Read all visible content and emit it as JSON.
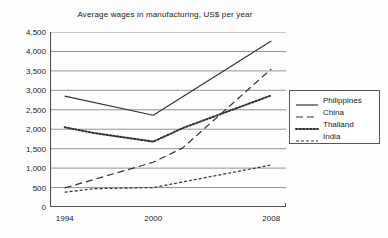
{
  "chart_data": {
    "type": "line",
    "title": "Average wages in manufacturing, US$ per year",
    "xlabel": "",
    "ylabel": "",
    "xlim": [
      1993,
      2009
    ],
    "ylim": [
      0,
      4500
    ],
    "grid": true,
    "legend_position": "right",
    "yticks": [
      0,
      500,
      1000,
      1500,
      2000,
      2500,
      3000,
      3500,
      4000,
      4500
    ],
    "ytick_labels": [
      "0",
      "500",
      "1,000",
      "1,500",
      "2,000",
      "2,500",
      "3,000",
      "3,500",
      "4,000",
      "4,500"
    ],
    "xticks": [
      1994,
      2000,
      2008
    ],
    "xtick_labels": [
      "1994",
      "2000",
      "2008"
    ],
    "series": [
      {
        "name": "Philippines",
        "style": "solid",
        "color": "#333333",
        "x": [
          1994,
          2000,
          2008
        ],
        "values": [
          2850,
          2360,
          4270
        ]
      },
      {
        "name": "China",
        "style": "dashed",
        "color": "#333333",
        "x": [
          1994,
          2000,
          2002,
          2008
        ],
        "values": [
          490,
          1150,
          1520,
          3550
        ]
      },
      {
        "name": "Thailand",
        "style": "dotted",
        "color": "#333333",
        "x": [
          1994,
          1996,
          2000,
          2002,
          2008
        ],
        "values": [
          2050,
          1900,
          1680,
          2030,
          2870
        ]
      },
      {
        "name": "India",
        "style": "dashdot",
        "color": "#333333",
        "x": [
          1994,
          1996,
          2000,
          2008
        ],
        "values": [
          380,
          470,
          500,
          1080
        ]
      }
    ]
  },
  "legend": {
    "entries": [
      {
        "label": "Philippines",
        "style": "solid"
      },
      {
        "label": "China",
        "style": "dashed"
      },
      {
        "label": "Thailand",
        "style": "dotted"
      },
      {
        "label": "India",
        "style": "dashdot"
      }
    ]
  },
  "colors": {
    "axis": "#555555",
    "grid": "#888888",
    "line": "#333333",
    "text": "#1a1a1a",
    "background": "#fdfdfd"
  }
}
